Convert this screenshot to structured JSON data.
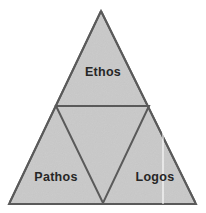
{
  "figure": {
    "name": "rhetorical-triangle",
    "background_color": "#ffffff",
    "top_text_remnant": ""
  },
  "diagram_data": {
    "type": "diagram",
    "shape": "triangle",
    "description": "Rhetorical triangle with an inverted inner triangle dividing the outer triangle into three labelled regions.",
    "fill_color": "#c9c9c9",
    "stroke_color": "#5a5a5a",
    "label_color": "#262626",
    "outer_triangle": {
      "apex": [
        101,
        11
      ],
      "bottom_left": [
        9,
        204
      ],
      "bottom_right": [
        196,
        204
      ]
    },
    "inner_triangle": {
      "left": [
        56,
        106
      ],
      "right": [
        149,
        106
      ],
      "bottom": [
        103,
        203
      ]
    },
    "regions": [
      {
        "id": "ethos",
        "label": "Ethos",
        "position": "top",
        "cx": 103,
        "cy": 72
      },
      {
        "id": "pathos",
        "label": "Pathos",
        "position": "bottom-left",
        "cx": 56,
        "cy": 177
      },
      {
        "id": "logos",
        "label": "Logos",
        "position": "bottom-right",
        "cx": 155,
        "cy": 177
      }
    ]
  },
  "labels": {
    "ethos": "Ethos",
    "pathos": "Pathos",
    "logos": "Logos"
  }
}
